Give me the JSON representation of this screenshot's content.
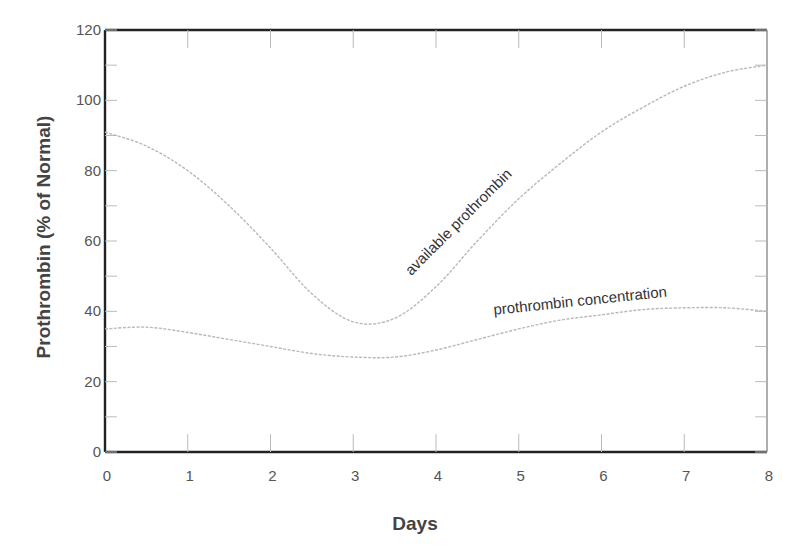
{
  "chart_data": {
    "type": "line",
    "title": "",
    "xlabel": "Days",
    "ylabel": "Prothrombin (% of Normal)",
    "xlim": [
      0,
      8
    ],
    "ylim": [
      0,
      120
    ],
    "x_ticks": [
      0,
      1,
      2,
      3,
      4,
      5,
      6,
      7,
      8
    ],
    "y_ticks": [
      0,
      20,
      40,
      60,
      80,
      100,
      120
    ],
    "grid": false,
    "legend": "none (inline curve annotations)",
    "series": [
      {
        "name": "available prothrombin",
        "x": [
          0,
          0.5,
          1,
          1.5,
          2,
          2.5,
          3,
          3.5,
          4,
          4.5,
          5,
          5.5,
          6,
          6.5,
          7,
          7.5,
          8
        ],
        "values": [
          91,
          87,
          80,
          70,
          58,
          45,
          37,
          38,
          47,
          60,
          72,
          82,
          91,
          98,
          104,
          108,
          110
        ]
      },
      {
        "name": "prothrombin concentration",
        "x": [
          0,
          0.5,
          1,
          1.5,
          2,
          2.5,
          3,
          3.5,
          4,
          4.5,
          5,
          5.5,
          6,
          6.5,
          7,
          7.5,
          8
        ],
        "values": [
          35,
          35.5,
          34,
          32,
          30,
          28,
          27,
          27,
          29,
          32,
          35,
          37.5,
          39,
          40.5,
          41,
          41,
          40
        ]
      }
    ],
    "annotations": [
      {
        "text": "available prothrombin",
        "x": 3.7,
        "y": 50,
        "rotation": -45
      },
      {
        "text": "prothrombin concentration",
        "x": 4.7,
        "y": 39,
        "rotation": -6
      }
    ]
  },
  "labels": {
    "x_axis_title": "Days",
    "y_axis_title": "Prothrombin (% of Normal)",
    "x_tick_labels": [
      "0",
      "1",
      "2",
      "3",
      "4",
      "5",
      "6",
      "7",
      "8"
    ],
    "y_tick_labels": [
      "0",
      "20",
      "40",
      "60",
      "80",
      "100",
      "120"
    ],
    "annot_available": "available prothrombin",
    "annot_concentration": "prothrombin concentration"
  }
}
